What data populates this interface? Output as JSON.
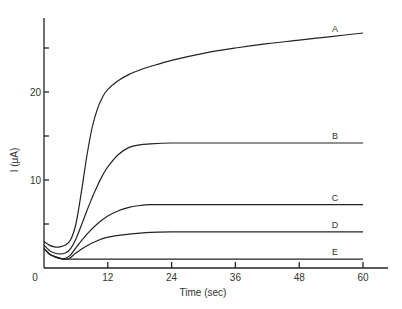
{
  "chart_data": {
    "type": "line",
    "title": "",
    "xlabel": "Time (sec)",
    "ylabel": "I (μA)",
    "xlim": [
      0,
      60
    ],
    "ylim": [
      0,
      28
    ],
    "x_ticks": [
      0,
      12,
      24,
      36,
      48,
      60
    ],
    "x_tick_labels": [
      "0",
      "12",
      "24",
      "36",
      "48",
      "60"
    ],
    "y_ticks": [
      5,
      10,
      15,
      20,
      25
    ],
    "y_tick_labels": [
      "",
      "10",
      "",
      "20",
      ""
    ],
    "grid": false,
    "legend": "inline labels at right end of each curve",
    "series": [
      {
        "name": "A",
        "x": [
          0,
          1,
          2,
          3,
          4,
          5,
          6,
          7,
          8,
          9,
          10,
          11,
          12,
          14,
          16,
          18,
          20,
          24,
          30,
          36,
          42,
          48,
          54,
          60
        ],
        "y": [
          3.0,
          2.6,
          2.4,
          2.4,
          2.6,
          3.2,
          5.0,
          8.5,
          12.5,
          15.8,
          18.0,
          19.4,
          20.3,
          21.3,
          22.0,
          22.5,
          22.9,
          23.6,
          24.4,
          25.0,
          25.5,
          25.9,
          26.3,
          26.7
        ]
      },
      {
        "name": "B",
        "x": [
          0,
          1,
          2,
          3,
          4,
          5,
          6,
          7,
          8,
          9,
          10,
          11,
          12,
          14,
          16,
          18,
          20,
          24,
          30,
          36,
          42,
          48,
          54,
          60
        ],
        "y": [
          2.6,
          2.0,
          1.7,
          1.6,
          1.7,
          2.2,
          3.3,
          4.8,
          6.4,
          7.9,
          9.3,
          10.5,
          11.5,
          12.9,
          13.7,
          14.0,
          14.1,
          14.2,
          14.2,
          14.2,
          14.2,
          14.2,
          14.2,
          14.2
        ]
      },
      {
        "name": "C",
        "x": [
          0,
          1,
          2,
          3,
          4,
          5,
          6,
          8,
          10,
          12,
          14,
          16,
          18,
          20,
          24,
          30,
          36,
          42,
          48,
          54,
          60
        ],
        "y": [
          2.2,
          1.6,
          1.3,
          1.1,
          1.1,
          1.5,
          2.3,
          3.8,
          5.0,
          5.9,
          6.5,
          6.9,
          7.1,
          7.2,
          7.2,
          7.2,
          7.2,
          7.2,
          7.2,
          7.2,
          7.2
        ]
      },
      {
        "name": "D",
        "x": [
          0,
          1,
          2,
          3,
          4,
          5,
          6,
          8,
          10,
          12,
          14,
          16,
          18,
          20,
          24,
          30,
          36,
          42,
          48,
          54,
          60
        ],
        "y": [
          2.2,
          1.6,
          1.3,
          1.1,
          1.0,
          1.2,
          1.7,
          2.5,
          3.1,
          3.5,
          3.7,
          3.85,
          3.95,
          4.05,
          4.1,
          4.1,
          4.1,
          4.1,
          4.1,
          4.1,
          4.1
        ]
      },
      {
        "name": "E",
        "x": [
          0,
          1,
          2,
          3,
          4,
          5,
          6,
          12,
          24,
          36,
          48,
          60
        ],
        "y": [
          2.2,
          1.6,
          1.3,
          1.1,
          1.0,
          1.0,
          1.0,
          1.0,
          1.0,
          1.0,
          1.0,
          1.0
        ]
      }
    ]
  }
}
